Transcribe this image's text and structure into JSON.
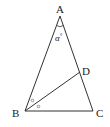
{
  "diagram": {
    "type": "triangle",
    "vertices": {
      "A": {
        "label": "A",
        "x": 60,
        "y": 16
      },
      "B": {
        "label": "B",
        "x": 25,
        "y": 111
      },
      "C": {
        "label": "C",
        "x": 93,
        "y": 111
      },
      "D": {
        "label": "D",
        "x": 80,
        "y": 72
      }
    },
    "segments": [
      "AB",
      "AC",
      "BC",
      "BD"
    ],
    "angle_label": "α°",
    "angle_label_parts": {
      "symbol": "α",
      "degree": "°"
    },
    "equal_angle_marks": [
      "∘",
      "∘"
    ],
    "stroke_color": "#333333"
  }
}
